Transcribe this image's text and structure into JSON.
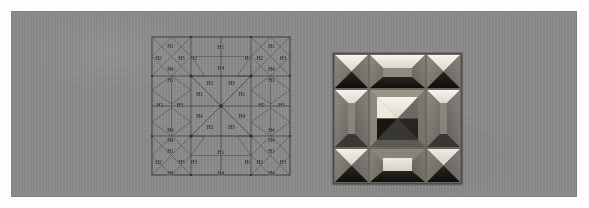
{
  "figure": {
    "background_color": "#8b8b8b",
    "page_color": "#fdfdfd",
    "ghost_text_top": "     ",
    "ghost_text_bottom": "    "
  },
  "diagram": {
    "name": "symmetric-h-tiling-diagram",
    "stroke_color": "#3b3b3b",
    "label_color": "#1f1f1f",
    "label_set": [
      "H1",
      "H2",
      "H3",
      "H4"
    ],
    "labels": [
      {
        "id": "tl-n",
        "text": "H1",
        "x": 20.5,
        "y": 12.0
      },
      {
        "id": "tl-w",
        "text": "H2",
        "x": 8.5,
        "y": 23.5
      },
      {
        "id": "tl-e",
        "text": "H3",
        "x": 31.5,
        "y": 23.5
      },
      {
        "id": "tl-s",
        "text": "H4",
        "x": 20.5,
        "y": 35.0
      },
      {
        "id": "tc-w",
        "text": "H2",
        "x": 44.0,
        "y": 23.5
      },
      {
        "id": "tc-n",
        "text": "H1",
        "x": 71.0,
        "y": 13.0
      },
      {
        "id": "tc-e",
        "text": "H1",
        "x": 98.0,
        "y": 23.5
      },
      {
        "id": "tc-s",
        "text": "H4",
        "x": 71.0,
        "y": 34.0
      },
      {
        "id": "tr-n",
        "text": "H1",
        "x": 121.5,
        "y": 12.0
      },
      {
        "id": "tr-w",
        "text": "H2",
        "x": 110.0,
        "y": 23.5
      },
      {
        "id": "tr-e",
        "text": "H3",
        "x": 133.0,
        "y": 23.5
      },
      {
        "id": "tr-s",
        "text": "H4",
        "x": 121.5,
        "y": 35.0
      },
      {
        "id": "ml-n",
        "text": "H1",
        "x": 20.5,
        "y": 45.5
      },
      {
        "id": "ml-w",
        "text": "H2",
        "x": 10.0,
        "y": 70.5
      },
      {
        "id": "ml-e",
        "text": "H3",
        "x": 30.0,
        "y": 70.5
      },
      {
        "id": "ml-s",
        "text": "H4",
        "x": 20.5,
        "y": 95.5
      },
      {
        "id": "ctr-nw",
        "text": "H2",
        "x": 60.0,
        "y": 48.5
      },
      {
        "id": "ctr-ne",
        "text": "H3",
        "x": 81.5,
        "y": 48.5
      },
      {
        "id": "ctr-w",
        "text": "H1",
        "x": 49.5,
        "y": 60.0
      },
      {
        "id": "ctr-e",
        "text": "H1",
        "x": 92.0,
        "y": 60.0
      },
      {
        "id": "ctr-sw",
        "text": "H4",
        "x": 49.5,
        "y": 81.5
      },
      {
        "id": "ctr-se",
        "text": "H4",
        "x": 92.0,
        "y": 81.5
      },
      {
        "id": "ctr-s1",
        "text": "H2",
        "x": 60.0,
        "y": 93.0
      },
      {
        "id": "ctr-s2",
        "text": "H3",
        "x": 81.5,
        "y": 93.0
      },
      {
        "id": "mr-n",
        "text": "H1",
        "x": 121.5,
        "y": 45.5
      },
      {
        "id": "mr-w",
        "text": "H2",
        "x": 111.5,
        "y": 70.5
      },
      {
        "id": "mr-e",
        "text": "H3",
        "x": 131.5,
        "y": 70.5
      },
      {
        "id": "mr-s",
        "text": "H4",
        "x": 121.5,
        "y": 95.5
      },
      {
        "id": "bl-n0",
        "text": "H4",
        "x": 20.5,
        "y": 106.0
      },
      {
        "id": "bl-n",
        "text": "H1",
        "x": 20.5,
        "y": 117.0
      },
      {
        "id": "bl-w",
        "text": "H2",
        "x": 8.5,
        "y": 128.0
      },
      {
        "id": "bl-e",
        "text": "H3",
        "x": 31.5,
        "y": 128.0
      },
      {
        "id": "bl-s",
        "text": "H4",
        "x": 20.5,
        "y": 138.5
      },
      {
        "id": "bc-w",
        "text": "H3",
        "x": 44.0,
        "y": 128.0
      },
      {
        "id": "bc-n",
        "text": "H1",
        "x": 71.0,
        "y": 117.5
      },
      {
        "id": "bc-e",
        "text": "H1",
        "x": 98.0,
        "y": 128.0
      },
      {
        "id": "bc-s",
        "text": "H4",
        "x": 71.0,
        "y": 138.5
      },
      {
        "id": "br-n0",
        "text": "H4",
        "x": 121.5,
        "y": 106.0
      },
      {
        "id": "br-n",
        "text": "H1",
        "x": 121.5,
        "y": 117.0
      },
      {
        "id": "br-w",
        "text": "H2",
        "x": 110.0,
        "y": 128.0
      },
      {
        "id": "br-e",
        "text": "H3",
        "x": 133.0,
        "y": 128.0
      },
      {
        "id": "br-s",
        "text": "H4",
        "x": 121.5,
        "y": 138.5
      }
    ]
  },
  "photograph": {
    "name": "pinwheel-quilt-block-photo",
    "grid": "3x3",
    "palette": {
      "light": "#efeadf",
      "highlight": "#f7f4ec",
      "mid_light": "#9a958c",
      "mid": "#7c7870",
      "mid_dark": "#5f5c56",
      "dark": "#1c1b19",
      "near_black": "#0f0f0e",
      "border": "#6d6a63"
    }
  }
}
